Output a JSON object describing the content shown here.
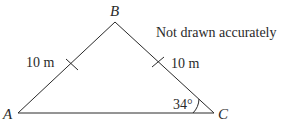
{
  "diagram": {
    "type": "isosceles-triangle",
    "note": "Not drawn accurately",
    "vertices": {
      "A": {
        "label": "A",
        "x": 18,
        "y": 113
      },
      "B": {
        "label": "B",
        "x": 115,
        "y": 22
      },
      "C": {
        "label": "C",
        "x": 214,
        "y": 113
      }
    },
    "sides": {
      "AB": {
        "length_label": "10 m",
        "equal_tick": true
      },
      "BC": {
        "length_label": "10 m",
        "equal_tick": true
      },
      "AC": {
        "length_label": "",
        "equal_tick": false
      }
    },
    "angles": {
      "C": {
        "label": "34°"
      }
    },
    "colors": {
      "stroke": "#2a2a2a",
      "background": "#ffffff"
    }
  }
}
